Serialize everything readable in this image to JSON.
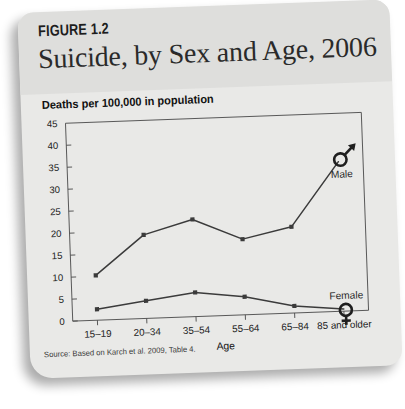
{
  "figure": {
    "number": "FIGURE 1.2",
    "title": "Suicide, by Sex and Age, 2006",
    "source": "Source: Based on Karch et al. 2009, Table 4."
  },
  "colors": {
    "card_background": "#e9e9e7",
    "header_band": "#dededc",
    "line": "#3b3b3b",
    "text": "#1a1a1a"
  },
  "chart_data": {
    "type": "line",
    "title": "Suicide, by Sex and Age, 2006",
    "xlabel": "Age",
    "ylabel": "Deaths per 100,000 in population",
    "categories": [
      "15–19",
      "20–34",
      "35–54",
      "55–64",
      "65–84",
      "85 and older"
    ],
    "yticks": [
      0,
      5,
      10,
      15,
      20,
      25,
      30,
      35,
      40,
      45
    ],
    "ylim": [
      0,
      45
    ],
    "grid": false,
    "legend_position": "inline-end-of-line",
    "series": [
      {
        "name": "Male",
        "marker": "mars-symbol",
        "values": [
          10.2,
          19.0,
          22.1,
          17.2,
          19.6,
          34.0
        ]
      },
      {
        "name": "Female",
        "marker": "venus-symbol",
        "values": [
          2.5,
          4.0,
          5.5,
          4.1,
          1.6,
          0.5
        ]
      }
    ],
    "annotations": [
      {
        "text": "Male",
        "series": "Male"
      },
      {
        "text": "Female",
        "series": "Female"
      }
    ]
  }
}
